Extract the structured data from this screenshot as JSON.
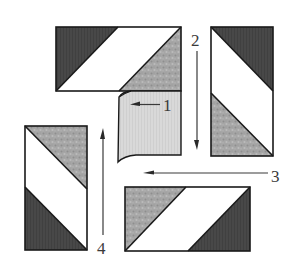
{
  "diagram": {
    "type": "quilt-block-assembly",
    "colors": {
      "dark": "#484848",
      "mottled": "#a3a3a3",
      "light": "#ffffff",
      "center": "#d8d8d8",
      "outline": "#1a1a1a"
    },
    "blocks": [
      {
        "id": "top",
        "position": "top",
        "shading": [
          "dark triangle upper-left",
          "white diagonal band",
          "mottled triangle lower-right"
        ]
      },
      {
        "id": "right",
        "position": "right",
        "shading": [
          "dark triangle upper-right",
          "white diagonal band",
          "mottled triangle lower-left"
        ]
      },
      {
        "id": "bottom",
        "position": "bottom",
        "shading": [
          "mottled triangle upper-left",
          "white diagonal band",
          "dark triangle lower-right"
        ]
      },
      {
        "id": "left",
        "position": "left",
        "shading": [
          "mottled triangle upper-right",
          "white diagonal band",
          "dark triangle lower-left"
        ]
      },
      {
        "id": "center",
        "position": "center",
        "shading": [
          "light gray square with curled corner"
        ]
      }
    ],
    "steps": [
      {
        "number": "1",
        "direction": "left"
      },
      {
        "number": "2",
        "direction": "down"
      },
      {
        "number": "3",
        "direction": "left"
      },
      {
        "number": "4",
        "direction": "up"
      }
    ]
  }
}
